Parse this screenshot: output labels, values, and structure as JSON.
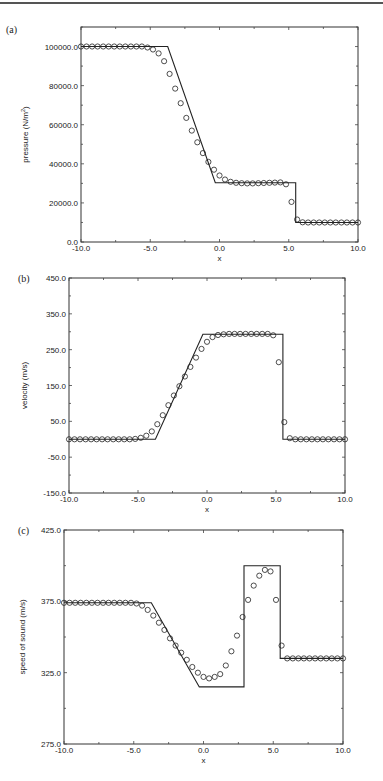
{
  "chart_data": [
    {
      "panel": "(a)",
      "type": "line",
      "title": "",
      "xlabel": "x",
      "ylabel": "pressure (N/m²)",
      "xlim": [
        -10,
        10
      ],
      "ylim": [
        0,
        110000
      ],
      "xticks": [
        "-10.0",
        "-5.0",
        "0.0",
        "5.0",
        "10.0"
      ],
      "yticks": [
        "0.0",
        "20000.0",
        "40000.0",
        "60000.0",
        "80000.0",
        "100000.0"
      ],
      "ytick_values": [
        0,
        20000,
        40000,
        60000,
        80000,
        100000
      ],
      "grid": false,
      "series": [
        {
          "name": "exact",
          "style": "solid-line",
          "x": [
            -10,
            -3.74,
            -0.3,
            5.5,
            5.5,
            10
          ],
          "y": [
            100000,
            100000,
            30313,
            30313,
            10000,
            10000
          ]
        },
        {
          "name": "numerical",
          "style": "open-circle",
          "x": [
            -10,
            -9.6,
            -9.2,
            -8.8,
            -8.4,
            -8.0,
            -7.6,
            -7.2,
            -6.8,
            -6.4,
            -6.0,
            -5.6,
            -5.2,
            -4.8,
            -4.4,
            -4.0,
            -3.6,
            -3.2,
            -2.8,
            -2.4,
            -2.0,
            -1.6,
            -1.2,
            -0.8,
            -0.4,
            0.0,
            0.4,
            0.8,
            1.2,
            1.6,
            2.0,
            2.4,
            2.8,
            3.2,
            3.6,
            4.0,
            4.4,
            4.8,
            5.2,
            5.6,
            6.0,
            6.4,
            6.8,
            7.2,
            7.6,
            8.0,
            8.4,
            8.8,
            9.2,
            9.6,
            10.0
          ],
          "y": [
            100000,
            100000,
            100000,
            100000,
            100000,
            100000,
            100000,
            100000,
            100000,
            100000,
            100000,
            100000,
            99500,
            98500,
            96500,
            92500,
            86000,
            78500,
            71000,
            63500,
            57000,
            51000,
            45500,
            41000,
            37000,
            34000,
            32000,
            30800,
            30300,
            30100,
            30000,
            30000,
            30100,
            30200,
            30300,
            30400,
            30500,
            29500,
            20500,
            11500,
            10100,
            10000,
            10000,
            10000,
            10000,
            10000,
            10000,
            10000,
            10000,
            10000,
            10000
          ]
        }
      ]
    },
    {
      "panel": "(b)",
      "type": "line",
      "title": "",
      "xlabel": "x",
      "ylabel": "velocity (m/s)",
      "xlim": [
        -10,
        10
      ],
      "ylim": [
        -150,
        450
      ],
      "xticks": [
        "-10.0",
        "-5.0",
        "0.0",
        "5.0",
        "10.0"
      ],
      "yticks": [
        "-150.0",
        "-50.0",
        "50.0",
        "150.0",
        "250.0",
        "350.0",
        "450.0"
      ],
      "ytick_values": [
        -150,
        -50,
        50,
        150,
        250,
        350
      ],
      "grid": false,
      "series": [
        {
          "name": "exact",
          "style": "solid-line",
          "x": [
            -10,
            -3.74,
            -0.3,
            5.5,
            5.5,
            10
          ],
          "y": [
            0,
            0,
            293,
            293,
            0,
            0
          ]
        },
        {
          "name": "numerical",
          "style": "open-circle",
          "x": [
            -10,
            -9.6,
            -9.2,
            -8.8,
            -8.4,
            -8.0,
            -7.6,
            -7.2,
            -6.8,
            -6.4,
            -6.0,
            -5.6,
            -5.2,
            -4.8,
            -4.4,
            -4.0,
            -3.6,
            -3.2,
            -2.8,
            -2.4,
            -2.0,
            -1.6,
            -1.2,
            -0.8,
            -0.4,
            0.0,
            0.4,
            0.8,
            1.2,
            1.6,
            2.0,
            2.4,
            2.8,
            3.2,
            3.6,
            4.0,
            4.4,
            4.8,
            5.2,
            5.6,
            6.0,
            6.4,
            6.8,
            7.2,
            7.6,
            8.0,
            8.4,
            8.8,
            9.2,
            9.6,
            10.0
          ],
          "y": [
            0,
            0,
            0,
            0,
            0,
            0,
            0,
            0,
            0,
            0,
            0,
            0,
            1,
            4,
            10,
            22,
            42,
            67,
            95,
            122,
            148,
            175,
            202,
            228,
            252,
            272,
            285,
            291,
            293,
            294,
            294,
            294,
            294,
            294,
            294,
            294,
            294,
            290,
            215,
            48,
            3,
            0,
            0,
            0,
            0,
            0,
            0,
            0,
            0,
            0,
            0
          ]
        }
      ]
    },
    {
      "panel": "(c)",
      "type": "line",
      "title": "",
      "xlabel": "x",
      "ylabel": "speed of sound (m/s)",
      "xlim": [
        -10,
        10
      ],
      "ylim": [
        275,
        425
      ],
      "xticks": [
        "-10.0",
        "-5.0",
        "0.0",
        "5.0",
        "10.0"
      ],
      "yticks": [
        "275.0",
        "325.0",
        "375.0",
        "425.0"
      ],
      "ytick_values": [
        275,
        325,
        375,
        425
      ],
      "grid": false,
      "series": [
        {
          "name": "exact",
          "style": "solid-line",
          "x": [
            -10,
            -3.74,
            -0.3,
            2.9,
            2.9,
            5.5,
            5.5,
            10
          ],
          "y": [
            374,
            374,
            315,
            315,
            400,
            400,
            335,
            335
          ]
        },
        {
          "name": "numerical",
          "style": "open-circle",
          "x": [
            -10,
            -9.6,
            -9.2,
            -8.8,
            -8.4,
            -8.0,
            -7.6,
            -7.2,
            -6.8,
            -6.4,
            -6.0,
            -5.6,
            -5.2,
            -4.8,
            -4.4,
            -4.0,
            -3.6,
            -3.2,
            -2.8,
            -2.4,
            -2.0,
            -1.6,
            -1.2,
            -0.8,
            -0.4,
            0.0,
            0.4,
            0.8,
            1.2,
            1.6,
            2.0,
            2.4,
            2.8,
            3.2,
            3.6,
            4.0,
            4.4,
            4.8,
            5.2,
            5.6,
            6.0,
            6.4,
            6.8,
            7.2,
            7.6,
            8.0,
            8.4,
            8.8,
            9.2,
            9.6,
            10.0
          ],
          "y": [
            374,
            374,
            374,
            374,
            374,
            374,
            374,
            374,
            374,
            374,
            374,
            374,
            374,
            373.5,
            372,
            369,
            365,
            360,
            355,
            349,
            344,
            339,
            334,
            329,
            325,
            322,
            321,
            322,
            324,
            330,
            340,
            351,
            364,
            376,
            386,
            393,
            397,
            396,
            376,
            344,
            335,
            335,
            335,
            335,
            335,
            335,
            335,
            335,
            335,
            335,
            335
          ]
        }
      ]
    }
  ],
  "panels": [
    {
      "label": "(a)",
      "ylabel": "pressure (N/m",
      "ylabel_sup": "2",
      "ylabel_tail": ")",
      "xlabel": "x"
    },
    {
      "label": "(b)",
      "ylabel": "velocity (m/s)",
      "xlabel": "x"
    },
    {
      "label": "(c)",
      "ylabel": "speed of sound (m/s)",
      "xlabel": "x"
    }
  ]
}
